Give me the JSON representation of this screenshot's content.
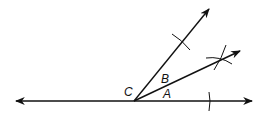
{
  "diagram": {
    "type": "angle-bisector-construction",
    "labels": {
      "vertex": "C",
      "angle_lower": "A",
      "angle_upper": "B"
    },
    "colors": {
      "stroke": "#111111",
      "background": "#ffffff"
    }
  }
}
